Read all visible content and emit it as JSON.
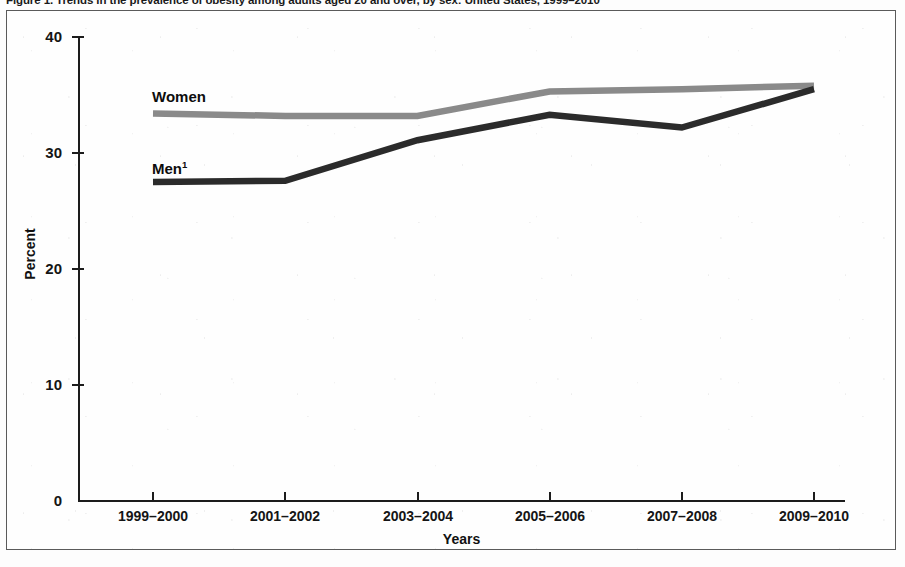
{
  "figure": {
    "title": "Figure 1. Trends in the prevalence of obesity among adults aged 20 and over, by sex: United States, 1999–2010"
  },
  "axes": {
    "y_title": "Percent",
    "x_title": "Years",
    "y_ticks": [
      "40",
      "30",
      "20",
      "10",
      "0"
    ],
    "x_ticks": [
      "1999–2000",
      "2001–2002",
      "2003–2004",
      "2005–2006",
      "2007–2008",
      "2009–2010"
    ]
  },
  "series_labels": {
    "women": "Women",
    "men": "Men",
    "men_footnote": "1"
  },
  "colors": {
    "women_line": "#8a8a8a",
    "men_line": "#2b2b2b",
    "axis": "#1c1c1c",
    "frame": "#5a5a5a",
    "background": "#fefefe"
  },
  "chart_data": {
    "type": "line",
    "title": "Figure 1. Trends in the prevalence of obesity among adults aged 20 and over, by sex: United States, 1999–2010",
    "xlabel": "Years",
    "ylabel": "Percent",
    "categories": [
      "1999–2000",
      "2001–2002",
      "2003–2004",
      "2005–2006",
      "2007–2008",
      "2009–2010"
    ],
    "series": [
      {
        "name": "Women",
        "color": "#8a8a8a",
        "values": [
          33.4,
          33.2,
          33.2,
          35.3,
          35.5,
          35.8
        ]
      },
      {
        "name": "Men",
        "color": "#2b2b2b",
        "values": [
          27.5,
          27.6,
          31.1,
          33.3,
          32.2,
          35.5
        ]
      }
    ],
    "ylim": [
      0,
      40
    ],
    "yticks": [
      0,
      10,
      20,
      30,
      40
    ],
    "grid": false,
    "legend": "inline-labels"
  }
}
